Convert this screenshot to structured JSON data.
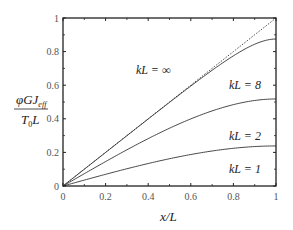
{
  "chart_data": {
    "type": "line",
    "title": "",
    "xlabel": "x/L",
    "ylabel": "φGJ_eff / (T_0 L)",
    "xlim": [
      0,
      1
    ],
    "ylim": [
      0,
      1
    ],
    "xticks": [
      "0",
      "0.2",
      "0.4",
      "0.6",
      "0.8",
      "1"
    ],
    "yticks": [
      "0",
      "0.2",
      "0.4",
      "0.6",
      "0.8",
      "1"
    ],
    "grid": false,
    "legend": "inline annotations",
    "x": [
      0,
      0.1,
      0.2,
      0.3,
      0.4,
      0.5,
      0.6,
      0.7,
      0.8,
      0.9,
      1.0
    ],
    "series": [
      {
        "name": "kL = ∞",
        "style": "dotted",
        "values": [
          0,
          0.1,
          0.2,
          0.3,
          0.4,
          0.5,
          0.6,
          0.7,
          0.8,
          0.9,
          1.0
        ]
      },
      {
        "name": "kL = 8",
        "style": "solid",
        "values": [
          0,
          0.0,
          0.075,
          0.175,
          0.275,
          0.375,
          0.475,
          0.575,
          0.675,
          0.775,
          0.875
        ]
      },
      {
        "name": "kL = 2",
        "style": "solid",
        "values": [
          0,
          0.0067,
          0.027,
          0.061,
          0.11,
          0.173,
          0.252,
          0.348,
          0.462,
          0.596,
          0.518
        ]
      },
      {
        "name": "kL = 1",
        "style": "solid",
        "values": [
          0,
          0.0013,
          0.0053,
          0.012,
          0.021,
          0.034,
          0.049,
          0.068,
          0.09,
          0.117,
          0.238
        ]
      }
    ],
    "annotations": [
      {
        "text": "kL = ∞",
        "x": 0.42,
        "y": 0.68
      },
      {
        "text": "kL = 8",
        "x": 0.82,
        "y": 0.56
      },
      {
        "text": "kL = 2",
        "x": 0.82,
        "y": 0.26
      },
      {
        "text": "kL = 1",
        "x": 0.82,
        "y": 0.06
      }
    ]
  },
  "labels": {
    "ylabel_num": "φGJ",
    "ylabel_sub": "eff",
    "ylabel_den": "T",
    "ylabel_den_sub": "0",
    "ylabel_den_tail": "L",
    "xlabel": "x/L",
    "curve_inf": "kL = ∞",
    "curve_8": "kL = 8",
    "curve_2": "kL = 2",
    "curve_1": "kL = 1"
  }
}
